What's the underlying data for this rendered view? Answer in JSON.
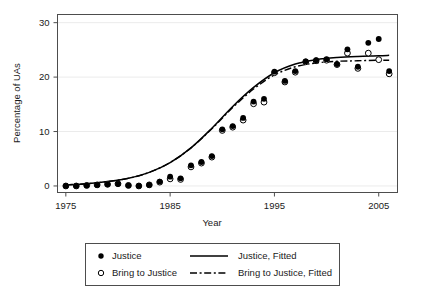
{
  "chart_data": {
    "type": "scatter",
    "title": "",
    "xlabel": "Year",
    "ylabel": "Percentage of UAs",
    "xlim": [
      1974.2,
      2006.8
    ],
    "ylim": [
      -1.2,
      31.5
    ],
    "xticks": [
      1975,
      1985,
      1995,
      2005
    ],
    "yticks": [
      0,
      10,
      20,
      30
    ],
    "xtick_labels": [
      "1975",
      "1985",
      "1995",
      "2005"
    ],
    "ytick_labels": [
      "0",
      "10",
      "20",
      "30"
    ],
    "grid": "horizontal-faint",
    "legend_position": "below-axes",
    "series": [
      {
        "name": "Justice",
        "marker": "filled-circle",
        "type": "scatter",
        "x": [
          1975,
          1976,
          1977,
          1978,
          1979,
          1980,
          1981,
          1982,
          1983,
          1984,
          1985,
          1986,
          1987,
          1988,
          1989,
          1990,
          1991,
          1992,
          1993,
          1994,
          1995,
          1996,
          1997,
          1998,
          1999,
          2000,
          2001,
          2002,
          2003,
          2004,
          2005,
          2006
        ],
        "values": [
          0.0,
          0.0,
          0.1,
          0.2,
          0.3,
          0.4,
          0.1,
          0.0,
          0.2,
          0.8,
          1.7,
          1.4,
          3.8,
          4.4,
          5.5,
          10.4,
          11.0,
          12.5,
          15.5,
          16.0,
          21.0,
          19.3,
          21.1,
          22.9,
          23.1,
          23.3,
          22.4,
          25.1,
          21.9,
          26.3,
          27.0,
          21.1
        ]
      },
      {
        "name": "Bring to Justice",
        "marker": "open-circle",
        "type": "scatter",
        "x": [
          1975,
          1976,
          1977,
          1978,
          1979,
          1980,
          1981,
          1982,
          1983,
          1984,
          1985,
          1986,
          1987,
          1988,
          1989,
          1990,
          1991,
          1992,
          1993,
          1994,
          1995,
          1996,
          1997,
          1998,
          1999,
          2000,
          2001,
          2002,
          2003,
          2004,
          2005,
          2006
        ],
        "values": [
          0.0,
          0.0,
          0.1,
          0.2,
          0.3,
          0.4,
          0.1,
          0.0,
          0.2,
          0.7,
          1.3,
          1.2,
          3.5,
          4.2,
          5.3,
          10.2,
          10.8,
          12.1,
          15.1,
          15.4,
          20.8,
          19.1,
          20.9,
          22.8,
          23.0,
          23.1,
          22.3,
          24.4,
          21.6,
          24.4,
          23.2,
          20.6
        ]
      },
      {
        "name": "Justice, Fitted",
        "type": "line",
        "style": "solid",
        "x": [
          1975,
          1977,
          1979,
          1981,
          1983,
          1985,
          1987,
          1989,
          1991,
          1993,
          1995,
          1997,
          1999,
          2001,
          2003,
          2005,
          2006
        ],
        "values": [
          0.2,
          0.4,
          0.8,
          1.4,
          2.5,
          4.3,
          7.0,
          10.6,
          14.6,
          18.1,
          20.8,
          22.4,
          23.2,
          23.6,
          23.8,
          23.9,
          24.0
        ]
      },
      {
        "name": "Bring to Justice, Fitted",
        "type": "line",
        "style": "dash-dot",
        "x": [
          1975,
          1977,
          1979,
          1981,
          1983,
          1985,
          1987,
          1989,
          1991,
          1993,
          1995,
          1997,
          1999,
          2001,
          2003,
          2005,
          2006
        ],
        "values": [
          0.2,
          0.4,
          0.8,
          1.4,
          2.5,
          4.3,
          7.0,
          10.5,
          14.4,
          17.8,
          20.4,
          21.9,
          22.6,
          22.9,
          23.0,
          23.1,
          23.1
        ]
      }
    ],
    "colors": {
      "marker_fill": "#000000",
      "marker_open": "#ffffff",
      "line": "#000000",
      "frame": "#4d4d4d",
      "grid": "#ebebeb",
      "background": "#ffffff"
    }
  },
  "legend": {
    "entries": [
      {
        "label": "Justice",
        "symbol": "filled-circle"
      },
      {
        "label": "Justice, Fitted",
        "symbol": "solid-line"
      },
      {
        "label": "Bring to Justice",
        "symbol": "open-circle"
      },
      {
        "label": "Bring to Justice, Fitted",
        "symbol": "dash-dot-line"
      }
    ]
  }
}
